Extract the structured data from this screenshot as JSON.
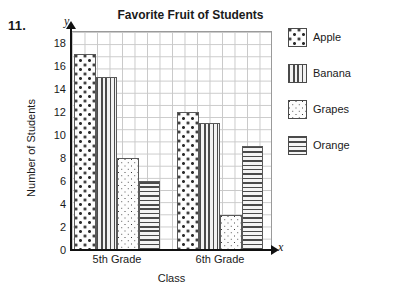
{
  "question_number": "11.",
  "axis_letters": {
    "y": "y",
    "x": "x"
  },
  "legend": {
    "items": [
      {
        "label": "Apple",
        "pattern": "large-dots"
      },
      {
        "label": "Banana",
        "pattern": "vertical-lines"
      },
      {
        "label": "Grapes",
        "pattern": "small-dots"
      },
      {
        "label": "Orange",
        "pattern": "horizontal-lines"
      }
    ]
  },
  "chart_data": {
    "type": "bar",
    "title": "Favorite Fruit of Students",
    "xlabel": "Class",
    "ylabel": "Number of Students",
    "categories": [
      "5th Grade",
      "6th Grade"
    ],
    "series": [
      {
        "name": "Apple",
        "values": [
          17,
          12
        ]
      },
      {
        "name": "Banana",
        "values": [
          15,
          11
        ]
      },
      {
        "name": "Grapes",
        "values": [
          8,
          3
        ]
      },
      {
        "name": "Orange",
        "values": [
          6,
          9
        ]
      }
    ],
    "ylim": [
      0,
      19
    ],
    "ytick_labels": [
      "0",
      "2",
      "4",
      "6",
      "8",
      "10",
      "12",
      "14",
      "16",
      "18"
    ],
    "ytick_values": [
      0,
      2,
      4,
      6,
      8,
      10,
      12,
      14,
      16,
      18
    ],
    "grid": true,
    "legend_position": "right"
  }
}
